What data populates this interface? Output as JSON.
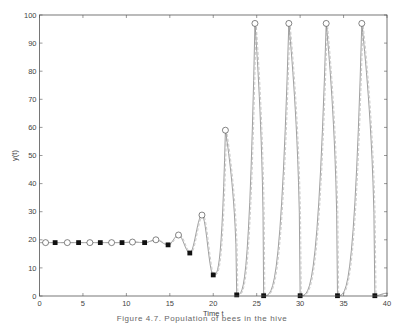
{
  "chart_data": {
    "type": "line",
    "title": "",
    "xlabel": "Time t",
    "ylabel": "y(t)",
    "xlim": [
      0,
      40
    ],
    "ylim": [
      0,
      100
    ],
    "grid": false,
    "legend": null,
    "xticks": [
      0,
      5,
      10,
      15,
      20,
      25,
      30,
      35,
      40
    ],
    "yticks": [
      0,
      10,
      20,
      30,
      40,
      50,
      60,
      70,
      80,
      90,
      100
    ],
    "series": [
      {
        "name": "curve",
        "style": "solid thin gray line with dashed overlay",
        "x": [
          0,
          0.7,
          1.8,
          3.2,
          4.5,
          5.8,
          7.0,
          8.3,
          9.5,
          10.7,
          12.1,
          13.4,
          14.8,
          16.0,
          17.3,
          18.7,
          20.0,
          21.4,
          22.7,
          24.8,
          25.8,
          28.7,
          30.0,
          33.0,
          34.3,
          37.1,
          38.6,
          40
        ],
        "values": [
          19,
          19,
          19,
          19,
          19,
          19,
          19,
          19,
          19,
          19.2,
          19,
          20,
          18.2,
          21.7,
          15.3,
          28.8,
          7.5,
          59,
          0.4,
          97,
          0.1,
          97,
          0.1,
          97,
          0.1,
          97,
          0.1,
          1
        ]
      },
      {
        "name": "circle-markers",
        "marker": "open circle",
        "x": [
          0.7,
          3.2,
          5.8,
          8.3,
          10.7,
          13.4,
          16.0,
          18.7,
          21.4,
          24.8,
          28.7,
          33.0,
          37.1
        ],
        "values": [
          19,
          19,
          19,
          19,
          19.2,
          20,
          21.7,
          28.8,
          59,
          97,
          97,
          97,
          97
        ]
      },
      {
        "name": "square-markers",
        "marker": "filled square",
        "x": [
          1.8,
          4.5,
          7.0,
          9.5,
          12.1,
          14.8,
          17.3,
          20.0,
          22.7,
          25.8,
          30.0,
          34.3,
          38.6
        ],
        "values": [
          19,
          19,
          19,
          19,
          19,
          18.2,
          15.3,
          7.5,
          0.4,
          0.1,
          0.1,
          0.1,
          0.1
        ]
      }
    ],
    "caption": "Figure 4.7. Population of bees in the hive"
  },
  "colors": {
    "axis": "#555555",
    "line": "#777777",
    "marker_fill": "#111111",
    "text": "#444444"
  }
}
